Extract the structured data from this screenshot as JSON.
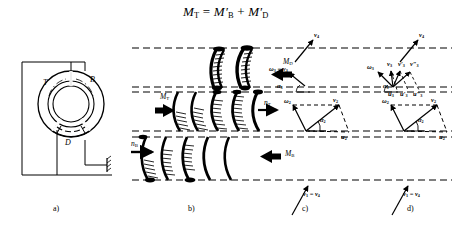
{
  "figure": {
    "title_equation": "M",
    "equation": {
      "lhs": "M",
      "lhs_sub": "T",
      "eq": "=",
      "term1": "M",
      "term1_prime": "′",
      "term1_sub": "B",
      "plus": "+",
      "term2": "M",
      "term2_prime": "′",
      "term2_sub": "D"
    }
  },
  "panels": {
    "a": {
      "caption": "a)",
      "parts": [
        {
          "name": "turbine",
          "label": "T"
        },
        {
          "name": "pump",
          "label": "B"
        },
        {
          "name": "stator",
          "label": "D"
        }
      ]
    },
    "b": {
      "caption": "b)",
      "labels": {
        "torque_stator": "M",
        "torque_stator_sub": "D",
        "torque_turbine": "M",
        "torque_turbine_sub": "T",
        "torque_pump": "M",
        "torque_pump_sub": "B",
        "speed_turbine": "n",
        "speed_turbine_sub": "T",
        "speed_pump": "n",
        "speed_pump_sub": "B"
      }
    },
    "c": {
      "caption": "c)",
      "labels": {
        "v4": "v",
        "v4_sub": "4",
        "omega3": "ω",
        "omega3_sub": "3",
        "eq": "=",
        "v3": "v",
        "v3_sub": "3",
        "alpha3": "α",
        "alpha3_sub": "3",
        "omega2": "ω",
        "omega2_sub": "2",
        "v2": "v",
        "v2_sub": "2",
        "alpha2": "α",
        "alpha2_sub": "2",
        "u2": "u",
        "u2_sub": "2",
        "v1v4": "v",
        "v1v4_sub1": "1",
        "v1v4_eq": "=",
        "v1v4_v": "v",
        "v1v4_sub2": "4"
      }
    },
    "d": {
      "caption": "d)",
      "labels": {
        "v4": "v",
        "v4_sub": "4",
        "omega3": "ω",
        "omega3_sub": "3",
        "v3": "v",
        "v3_sub": "3",
        "v3p": "v",
        "v3p_prime": "′",
        "v3p_sub": "3",
        "v3pp": "v",
        "v3pp_prime": "″",
        "v3pp_sub": "3",
        "u3": "u",
        "u3_sub": "3",
        "u3p": "u",
        "u3p_prime": "′",
        "u3p_sub": "3",
        "u3pp": "u",
        "u3pp_prime": "″",
        "u3pp_sub": "3",
        "alpha3": "α",
        "alpha3_sub": "3",
        "omega2": "ω",
        "omega2_sub": "2",
        "v2": "v",
        "v2_sub": "2",
        "alpha2": "α",
        "alpha2_sub": "2",
        "u2": "u",
        "u2_sub": "2",
        "v1v4": "v",
        "v1v4_sub1": "1",
        "v1v4_eq": "=",
        "v1v4_v": "v",
        "v1v4_sub2": "4"
      }
    }
  },
  "colors": {
    "ink": "#000000",
    "paper": "#ffffff",
    "dash": "#1a1a1a"
  }
}
